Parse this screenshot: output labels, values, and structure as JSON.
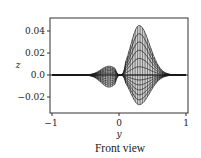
{
  "chart_data": {
    "type": "line",
    "title": "",
    "caption": "Front view",
    "xlabel": "y",
    "ylabel": "z",
    "xlim": [
      -1,
      1
    ],
    "ylim": [
      -0.035,
      0.05
    ],
    "xticks": [
      -1,
      0,
      1
    ],
    "xtick_labels": [
      "−1",
      "0",
      "1"
    ],
    "yticks": [
      0.04,
      0.02,
      0.0,
      -0.02
    ],
    "ytick_labels": [
      "0.04",
      "0.02",
      "0.0",
      "−0.02"
    ],
    "grid": false,
    "features": {
      "left_lobe": {
        "y_center": -0.15,
        "z_max": 0.008,
        "z_min": -0.011
      },
      "right_lobe": {
        "y_center": 0.3,
        "z_max": 0.045,
        "z_min": -0.027
      },
      "zero_crossing": 0.0,
      "tails": "curves converge to z=0 near y=-0.5 and y=0.9"
    },
    "n_curves": 12,
    "line_color": "#1a1a1a"
  },
  "labels": {
    "caption": "Front view",
    "xlabel": "y",
    "ylabel": "z",
    "xtick_m1": "−1",
    "xtick_0": "0",
    "xtick_1": "1",
    "ytick_004": "0.04",
    "ytick_002": "0.02",
    "ytick_000": "0.0",
    "ytick_m002": "−0.02"
  }
}
